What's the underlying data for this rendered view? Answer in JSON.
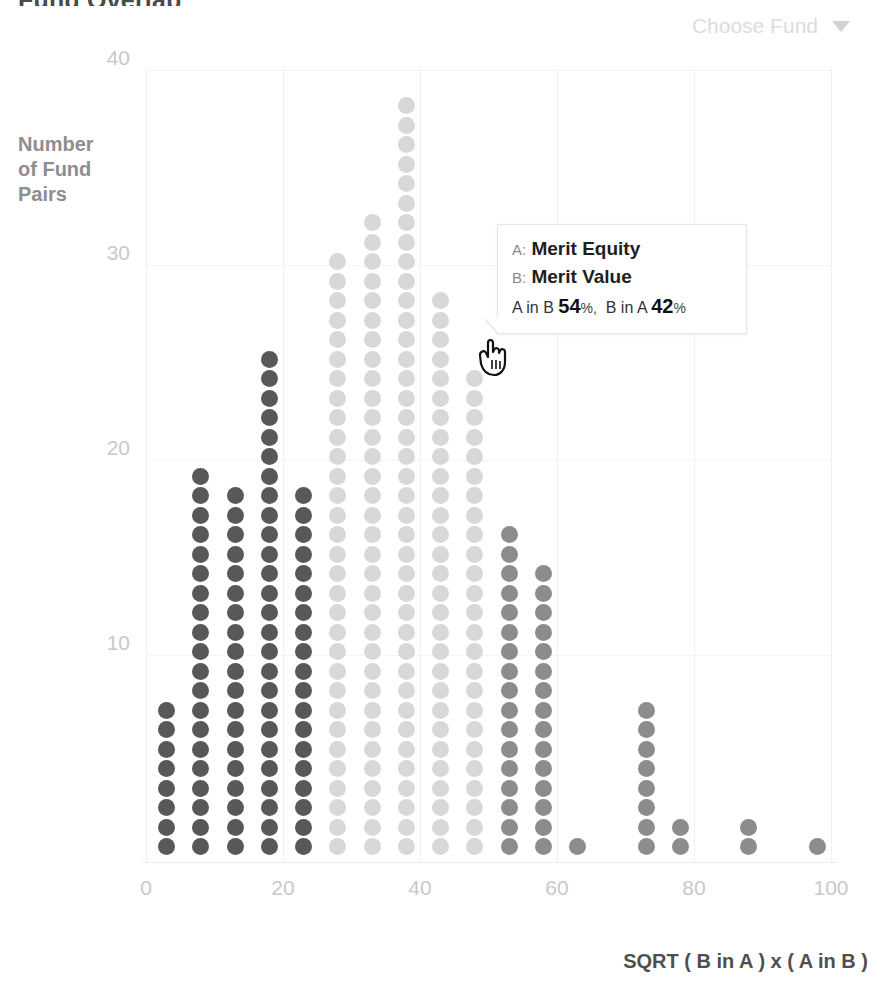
{
  "header": {
    "title": "Fund Overlap",
    "fund_picker_label": "Choose Fund",
    "caret_icon": "chevron-down-icon"
  },
  "tooltip": {
    "a_key": "A:",
    "a_value": "Merit Equity",
    "b_key": "B:",
    "b_value": "Merit Value",
    "a_in_b_label": "A in B",
    "a_in_b_value": "54",
    "a_in_b_unit": "%",
    "separator": ",",
    "b_in_a_label": "B in A",
    "b_in_a_value": "42",
    "b_in_a_unit": "%"
  },
  "colors": {
    "dot_dark": "#585858",
    "dot_mid": "#8c8c8c",
    "dot_light": "#d8d8d8",
    "axis_text": "#c9c9c9",
    "ylabel_text": "#8e8e8e",
    "xlabel_text": "#4f4f4f",
    "picker_text": "#dcdcdc",
    "gridline": "#f1f1f1",
    "background": "#ffffff"
  },
  "chart_data": {
    "type": "bar",
    "subtype": "dot-histogram",
    "title": "Fund Overlap",
    "xlabel": "SQRT ( B in A ) x ( A in B )",
    "ylabel": "Number of Fund Pairs",
    "ylabel_lines": [
      "Number",
      "of Fund",
      "Pairs"
    ],
    "xlim": [
      0,
      100
    ],
    "ylim": [
      0,
      40
    ],
    "xticks": [
      0,
      20,
      40,
      60,
      80,
      100
    ],
    "yticks": [
      10,
      20,
      30,
      40
    ],
    "grid": true,
    "legend": null,
    "dot_unit": 1,
    "categories": [
      3,
      8,
      13,
      18,
      23,
      28,
      33,
      38,
      43,
      48,
      53,
      58,
      63,
      73,
      78,
      88,
      98
    ],
    "values": [
      8,
      20,
      19,
      26,
      19,
      31,
      33,
      39,
      29,
      25,
      17,
      15,
      1,
      8,
      2,
      2,
      1
    ],
    "shades": [
      "dark",
      "dark",
      "dark",
      "dark",
      "dark",
      "light",
      "light",
      "light",
      "light",
      "light",
      "mid",
      "mid",
      "mid",
      "mid",
      "mid",
      "mid",
      "mid"
    ],
    "highlighted_point": {
      "x": 48,
      "y": 25,
      "series": "light"
    }
  }
}
